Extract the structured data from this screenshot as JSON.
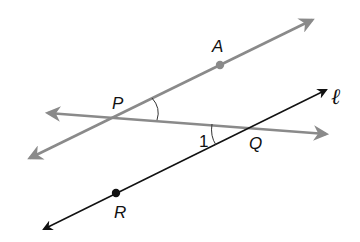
{
  "diagram": {
    "type": "geometry",
    "colors": {
      "gray_line": "#8a8a8a",
      "black_line": "#111111",
      "background": "#ffffff"
    },
    "points": [
      {
        "id": "P",
        "label": "P",
        "x": 113,
        "y": 117
      },
      {
        "id": "A",
        "label": "A",
        "x": 220,
        "y": 65,
        "dot": true
      },
      {
        "id": "Q",
        "label": "Q",
        "x": 257,
        "y": 127
      },
      {
        "id": "R",
        "label": "R",
        "x": 116,
        "y": 193,
        "dot": true
      }
    ],
    "lines": [
      {
        "id": "PA",
        "through": [
          "P",
          "A"
        ],
        "color": "gray",
        "arrows": "both"
      },
      {
        "id": "PQ",
        "through": [
          "P",
          "Q"
        ],
        "color": "gray",
        "arrows": "both"
      },
      {
        "id": "l",
        "name": "ℓ",
        "through": [
          "R",
          "Q"
        ],
        "color": "black",
        "arrows": "both"
      }
    ],
    "angles": [
      {
        "vertex": "P",
        "between": [
          "A",
          "Q"
        ],
        "marked": true
      },
      {
        "vertex": "Q",
        "between": [
          "P",
          "R"
        ],
        "label": "1"
      }
    ],
    "labels": {
      "A": "A",
      "P": "P",
      "Q": "Q",
      "R": "R",
      "line_l": "ℓ",
      "angle_1": "1"
    }
  }
}
